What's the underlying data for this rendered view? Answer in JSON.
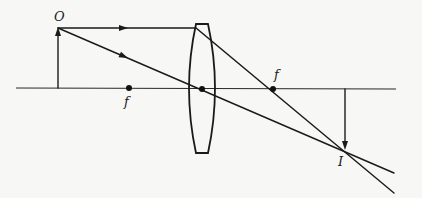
{
  "diagram": {
    "type": "thin converging lens ray diagram",
    "colors": {
      "ink": "#1a1a1a",
      "background": "#f7f7f5"
    },
    "labels": {
      "object": "O",
      "focal_left": "f",
      "focal_right": "f",
      "image": "I"
    },
    "optical_axis": {
      "x1": 16,
      "x2": 396,
      "y": 88
    },
    "lens": {
      "cx": 202,
      "top": 24,
      "bottom": 153,
      "half_width": 14
    },
    "object_arrow": {
      "x": 58,
      "base_y": 88,
      "tip_y": 28,
      "direction": "up"
    },
    "image_arrow": {
      "x": 345,
      "base_y": 89,
      "tip_y": 150,
      "direction": "down"
    },
    "focal_points": [
      {
        "name": "f-left",
        "x": 129,
        "y": 88
      },
      {
        "name": "f-right",
        "x": 273,
        "y": 89
      }
    ],
    "lens_center": {
      "x": 202,
      "y": 89
    },
    "rays": [
      {
        "name": "parallel-ray",
        "points": [
          [
            58,
            28
          ],
          [
            196,
            28
          ],
          [
            394,
            193
          ]
        ],
        "arrow_at": [
          124,
          29
        ]
      },
      {
        "name": "central-ray",
        "points": [
          [
            58,
            28
          ],
          [
            394,
            173
          ]
        ],
        "arrow_at": [
          124,
          56
        ]
      }
    ]
  }
}
